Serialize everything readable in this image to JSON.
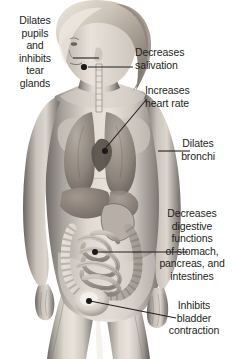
{
  "figure": {
    "background_color": "#ffffff",
    "text_color": "#231f20",
    "leader_line_color": "#231f20",
    "marker_color": "#1a1a1a",
    "image_style": "grayscale anatomical photo illustration"
  },
  "labels": {
    "pupils": {
      "text": "Dilates\npupils\nand\ninhibits\ntear\nglands",
      "align": "center",
      "target_organ": "eye"
    },
    "salivation": {
      "text": "Decreases\nsalivation",
      "align": "left",
      "target_organ": "salivary-gland"
    },
    "heart": {
      "text": "Increases\nheart rate",
      "align": "left",
      "target_organ": "heart"
    },
    "bronchi": {
      "text": "Dilates\nbronchi",
      "align": "center",
      "target_organ": "lung"
    },
    "digestive": {
      "text": "Decreases\ndigestive\nfunctions\nof stomach,\npancreas, and\nintestines",
      "align": "center",
      "target_organ": "intestines"
    },
    "bladder": {
      "text": "Inhibits\nbladder\ncontraction",
      "align": "center",
      "target_organ": "bladder"
    }
  },
  "markers": [
    {
      "name": "salivary-gland-marker",
      "x": 83,
      "y": 67
    },
    {
      "name": "heart-marker",
      "x": 108,
      "y": 148
    },
    {
      "name": "lung-marker",
      "x": 118,
      "y": 152
    },
    {
      "name": "intestines-marker",
      "x": 94,
      "y": 251
    },
    {
      "name": "bladder-marker",
      "x": 88,
      "y": 301
    }
  ]
}
